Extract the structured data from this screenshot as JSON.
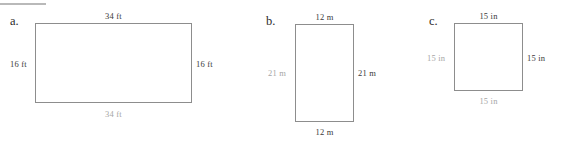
{
  "sheet": {
    "background_color": "#ffffff",
    "rule_color": "#b9b9b9",
    "outline_color": "#8d8d8d",
    "label_dark_color": "#3a3a3a",
    "label_light_color": "#a6a6a6"
  },
  "figures": [
    {
      "letter": "a.",
      "shape": "rectangle",
      "unit": "ft",
      "width_value": "34",
      "height_value": "16",
      "labels": {
        "top": "34 ft",
        "bottom": "34 ft",
        "left": "16 ft",
        "right": "16 ft"
      }
    },
    {
      "letter": "b.",
      "shape": "rectangle",
      "unit": "m",
      "width_value": "12",
      "height_value": "21",
      "labels": {
        "top": "12 m",
        "bottom": "12 m",
        "left": "21 m",
        "right": "21 m"
      }
    },
    {
      "letter": "c.",
      "shape": "square",
      "unit": "in",
      "width_value": "15",
      "height_value": "15",
      "labels": {
        "top": "15 in",
        "bottom": "15 in",
        "left": "15 in",
        "right": "15 in"
      }
    }
  ]
}
